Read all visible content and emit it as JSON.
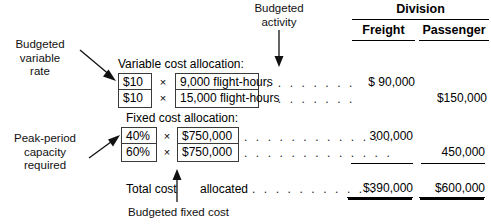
{
  "table": {
    "group_header": "Division",
    "columns": [
      {
        "key": "freight",
        "label": "Freight"
      },
      {
        "key": "passenger",
        "label": "Passenger"
      }
    ]
  },
  "callouts": {
    "budgeted_variable_rate": "Budgeted\nvariable\nrate",
    "budgeted_variable_rate_lines": [
      "Budgeted",
      "variable",
      "rate"
    ],
    "budgeted_activity_lines": [
      "Budgeted",
      "activity"
    ],
    "peak_period_lines": [
      "Peak-period",
      "capacity",
      "required"
    ],
    "budgeted_fixed_cost": "Budgeted fixed cost"
  },
  "sections": {
    "variable": {
      "heading": "Variable cost allocation:",
      "rows": [
        {
          "rate": "$10",
          "operator": "×",
          "driver": "9,000 flight-hours",
          "leader": ". . . . . . . .",
          "freight": "$  90,000",
          "passenger": ""
        },
        {
          "rate": "$10",
          "operator": "×",
          "driver": "15,000 flight-hours",
          "leader": ". . . . . . . .",
          "freight": "",
          "passenger": "$150,000"
        }
      ]
    },
    "fixed": {
      "heading": "Fixed cost allocation:",
      "rows": [
        {
          "rate": "40%",
          "operator": "×",
          "driver": "$750,000",
          "leader": ". . . . . . . . . . . . .",
          "freight": "300,000",
          "passenger": ""
        },
        {
          "rate": "60%",
          "operator": "×",
          "driver": "$750,000",
          "leader": ". . . . . . . . . . . . .",
          "freight": "",
          "passenger": "450,000"
        }
      ]
    },
    "total": {
      "label_left": "Total cost",
      "label_right": "allocated",
      "leader": ". . . . . . . . . . .",
      "freight": "$390,000",
      "passenger": "$600,000"
    }
  }
}
